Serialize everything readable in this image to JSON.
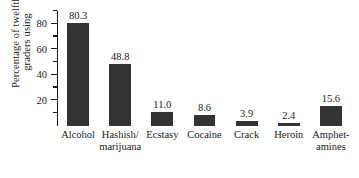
{
  "chart_data": {
    "type": "bar",
    "title": "",
    "subtitle": "",
    "xlabel": "",
    "ylabel": "Percentage of twelfth graders using",
    "ylabel_lines": [
      "Percentage of twelfth",
      "graders using"
    ],
    "categories": [
      "Alcohol",
      "Hashish/\nmarijuana",
      "Ecstasy",
      "Cocaine",
      "Crack",
      "Heroin",
      "Amphet-\namines"
    ],
    "values": [
      80.3,
      48.8,
      11.0,
      8.6,
      3.9,
      2.4,
      15.6
    ],
    "value_labels": [
      "80.3",
      "48.8",
      "11.0",
      "8.6",
      "3.9",
      "2.4",
      "15.6"
    ],
    "ylim": [
      0,
      90
    ],
    "y_major_ticks": [
      20,
      40,
      60,
      80
    ],
    "y_major_tick_labels": [
      "20",
      "40",
      "60",
      "80"
    ],
    "y_minor_ticks": [
      10,
      30,
      50,
      70,
      90
    ],
    "grid": false,
    "legend": null,
    "legend_position": "none",
    "bar_color": "#333333",
    "axis_color": "#1a1a1a",
    "background_color": "#ffffff"
  }
}
